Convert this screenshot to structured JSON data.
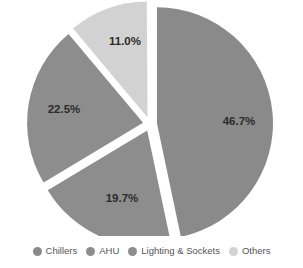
{
  "chart_data": {
    "type": "pie",
    "title": "",
    "subtitle": "",
    "xlabel": "",
    "ylabel": "",
    "grid": false,
    "legend_position": "bottom",
    "exploded": true,
    "background_color": "#ffffff",
    "label_text_color": "#2b2b2b",
    "categories": [
      "Chillers",
      "AHU",
      "Lighting & Sockets",
      "Others"
    ],
    "values": [
      46.7,
      19.7,
      22.5,
      11.0
    ],
    "data_labels": [
      "46.7%",
      "19.7%",
      "22.5%",
      "11.0%"
    ],
    "colors": [
      "#8a8a8a",
      "#8d8d8d",
      "#8d8d8d",
      "#d2d2d2"
    ],
    "slices": [
      {
        "name": "Chillers",
        "value": 46.7,
        "label": "46.7%",
        "color": "#8a8a8a",
        "start_angle": 0,
        "end_angle": 168.1,
        "explode_angle": 84.0,
        "label_x": 239,
        "label_y": 122
      },
      {
        "name": "Lighting & Sockets",
        "value": 19.7,
        "label": "19.7%",
        "color": "#8d8d8d",
        "start_angle": 168.1,
        "end_angle": 239.0,
        "explode_angle": 203.6,
        "label_x": 122,
        "label_y": 199
      },
      {
        "name": "AHU",
        "value": 22.5,
        "label": "22.5%",
        "color": "#8d8d8d",
        "start_angle": 239.0,
        "end_angle": 320.0,
        "explode_angle": 279.5,
        "label_x": 64,
        "label_y": 110
      },
      {
        "name": "Others",
        "value": 11.0,
        "label": "11.0%",
        "color": "#d2d2d2",
        "start_angle": 320.0,
        "end_angle": 359.6,
        "explode_angle": 339.8,
        "label_x": 125,
        "label_y": 42
      }
    ]
  },
  "legend": {
    "items": [
      {
        "label": "Chillers",
        "color": "#8a8a8a"
      },
      {
        "label": "AHU",
        "color": "#8d8d8d"
      },
      {
        "label": "Lighting & Sockets",
        "color": "#8d8d8d"
      },
      {
        "label": "Others",
        "color": "#d2d2d2"
      }
    ]
  },
  "geometry": {
    "center_x": 150,
    "center_y": 124,
    "radius": 116,
    "explode_offset": 7
  }
}
